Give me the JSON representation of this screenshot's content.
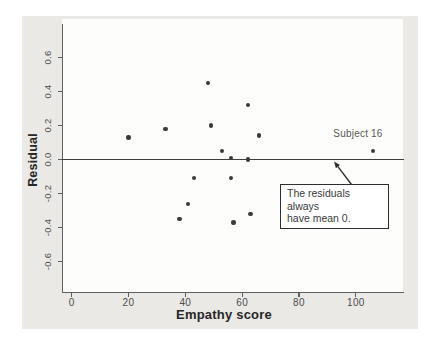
{
  "chart_data": {
    "type": "scatter",
    "title": "",
    "xlabel": "Empathy score",
    "ylabel": "Residual",
    "xlim": [
      -3.4,
      116.6
    ],
    "ylim": [
      -0.775,
      0.825
    ],
    "x_ticks": [
      0,
      20,
      40,
      60,
      80,
      100
    ],
    "y_ticks": [
      -0.6,
      -0.4,
      -0.2,
      0.0,
      0.2,
      0.4,
      0.6
    ],
    "reference_line_y": 0.0,
    "grid": false,
    "legend": "none",
    "points": [
      {
        "x": 20,
        "y": 0.13
      },
      {
        "x": 33,
        "y": 0.18
      },
      {
        "x": 48,
        "y": 0.45
      },
      {
        "x": 49,
        "y": 0.2
      },
      {
        "x": 53,
        "y": 0.05
      },
      {
        "x": 56,
        "y": 0.01
      },
      {
        "x": 62,
        "y": 0.0
      },
      {
        "x": 62,
        "y": 0.32
      },
      {
        "x": 66,
        "y": 0.14
      },
      {
        "x": 43,
        "y": -0.11
      },
      {
        "x": 56,
        "y": -0.11
      },
      {
        "x": 41,
        "y": -0.26
      },
      {
        "x": 38,
        "y": -0.35
      },
      {
        "x": 57,
        "y": -0.37
      },
      {
        "x": 63,
        "y": -0.32
      },
      {
        "x": 106,
        "y": 0.05,
        "label": "Subject 16"
      }
    ],
    "annotations": {
      "point_label": "Subject 16",
      "callout_line1": "The residuals always",
      "callout_line2": "have mean 0.",
      "callout_points_to": "zero reference line"
    }
  },
  "colors": {
    "panel_background": "#eae9e5",
    "plot_background": "#fdfdfb",
    "axis": "#5f5f5f",
    "zero_line": "#3e3e3e",
    "point": "#3a3a3a",
    "tick_label": "#4c4c4c",
    "axis_title": "#262626",
    "subject_label": "#585858",
    "callout_border": "#2e2e2e",
    "callout_text": "#3a3a3a"
  }
}
